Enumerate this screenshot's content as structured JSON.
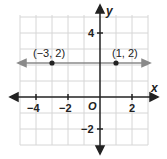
{
  "graph": {
    "x_axis_label": "x",
    "y_axis_label": "y",
    "origin_label": "O",
    "x_ticks": [
      {
        "value": -4,
        "label": "−4"
      },
      {
        "value": -2,
        "label": "−2"
      },
      {
        "value": 2,
        "label": "2"
      }
    ],
    "y_ticks": [
      {
        "value": 4,
        "label": "4"
      },
      {
        "value": -2,
        "label": "−2"
      }
    ],
    "x_range": [
      -5,
      3
    ],
    "y_range": [
      -3,
      5
    ],
    "points": [
      {
        "x": -3,
        "y": 2,
        "label": "(−3, 2)"
      },
      {
        "x": 1,
        "y": 2,
        "label": "(1, 2)"
      }
    ],
    "line": {
      "equation": "y = 2",
      "color": "#8a8a8a"
    },
    "colors": {
      "grid": "#d4d4d4",
      "axis": "#222222",
      "point": "#222222"
    }
  }
}
